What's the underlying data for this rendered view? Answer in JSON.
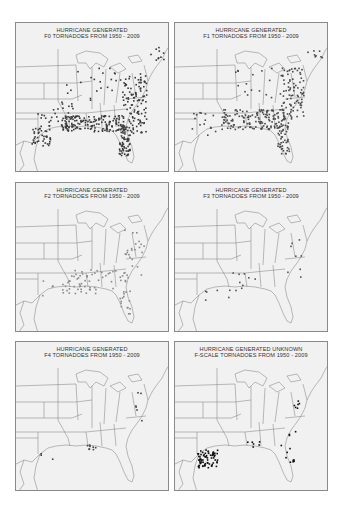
{
  "figure": {
    "panels": [
      {
        "id": "f0",
        "title_line1": "HURRICANE  GENERATED",
        "title_line2": "F0 TORNADOES  FROM  1950 - 2009",
        "density": "very high",
        "dot_color": "#3a3a3a"
      },
      {
        "id": "f1",
        "title_line1": "HURRICANE  GENERATED",
        "title_line2": "F1 TORNADOES  FROM  1950 - 2009",
        "density": "very high",
        "dot_color": "#4a4a4a"
      },
      {
        "id": "f2",
        "title_line1": "HURRICANE  GENERATED",
        "title_line2": "F2 TORNADOES  FROM  1950 - 2009",
        "density": "moderate",
        "dot_color": "#8a8a8a"
      },
      {
        "id": "f3",
        "title_line1": "HURRICANE  GENERATED",
        "title_line2": "F3 TORNADOES  FROM  1950 - 2009",
        "density": "low",
        "dot_color": "#555555"
      },
      {
        "id": "f4",
        "title_line1": "HURRICANE  GENERATED",
        "title_line2": "F4 TORNADOES  FROM  1950 - 2009",
        "density": "very low",
        "dot_color": "#444444"
      },
      {
        "id": "unknown",
        "title_line1": "HURRICANE  GENERATED  UNKNOWN",
        "title_line2": "F-SCALE TORNADOES  FROM  1950 - 2009",
        "density": "clustered in southeast Texas",
        "dot_color": "#111111"
      }
    ]
  },
  "colors": {
    "background": "#ffffff",
    "map_fill": "#f1f1f1",
    "border": "#8a8a8a",
    "state_lines": "#7a7a7a",
    "title_text": "#333333"
  }
}
